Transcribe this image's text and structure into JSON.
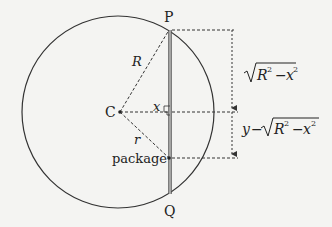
{
  "diagram": {
    "labels": {
      "P": "P",
      "Q": "Q",
      "C": "C",
      "R": "R",
      "r": "r",
      "x": "x",
      "package": "package",
      "sqrt_expr": "√R² − x²",
      "y_minus_expr": "y − √R² − x²"
    },
    "colors": {
      "stroke": "#333333",
      "chord": "#555555",
      "background": "#f4f4f2"
    }
  }
}
